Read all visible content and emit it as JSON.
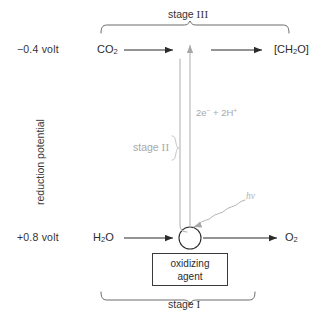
{
  "diagram": {
    "title_note": "Z-scheme photosynthesis reduction potential diagram",
    "axis": {
      "label": "reduction potential"
    },
    "potentials": {
      "top": "−0.4 volt",
      "bottom": "+0.8 volt"
    },
    "species": {
      "co2": "CO",
      "co2_sub": "2",
      "product": "[CH",
      "product_sub": "2",
      "product_tail": "O]",
      "water": "H",
      "water_sub": "2",
      "water_tail": "O",
      "oxygen": "O",
      "oxygen_sub": "2"
    },
    "stages": {
      "top_label": "stage",
      "top_numeral": "III",
      "mid_label": "stage",
      "mid_numeral": "II",
      "bottom_label": "stage",
      "bottom_numeral": "I"
    },
    "annotations": {
      "electrons": "2e",
      "electrons_sup": "−",
      "electrons_mid": " + 2H",
      "electrons_sup2": "+",
      "photon": "hν"
    },
    "box": {
      "line1": "oxidizing",
      "line2": "agent"
    },
    "colors": {
      "ink": "#2b2b2b",
      "gray": "#a8a8a8",
      "background": "#ffffff"
    }
  }
}
